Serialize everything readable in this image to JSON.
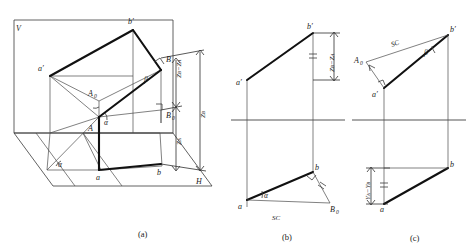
{
  "figure": {
    "captions": [
      {
        "id": "cap-a",
        "text": "(a)",
        "x": 138,
        "y": 237
      },
      {
        "id": "cap-b",
        "text": "(b)",
        "x": 285,
        "y": 240
      },
      {
        "id": "cap-c",
        "text": "(c)",
        "x": 412,
        "y": 241
      }
    ],
    "panel_a": {
      "name": "pictorial-projection-diagram",
      "plane_labels": [
        {
          "id": "v-plane",
          "text": "V",
          "x": 16,
          "y": 28
        },
        {
          "id": "h-plane",
          "text": "H",
          "x": 196,
          "y": 184
        }
      ],
      "points": [
        {
          "id": "a-prime",
          "text": "a′",
          "x": 40,
          "y": 69
        },
        {
          "id": "b-prime",
          "text": "b′",
          "x": 128,
          "y": 22
        },
        {
          "id": "point-B",
          "text": "B",
          "x": 166,
          "y": 61
        },
        {
          "id": "point-A",
          "text": "A",
          "x": 82,
          "y": 129
        },
        {
          "id": "point-a",
          "text": "a",
          "x": 97,
          "y": 176
        },
        {
          "id": "point-b",
          "text": "b",
          "x": 158,
          "y": 172
        },
        {
          "id": "point-A0",
          "text": "A",
          "sub": "0",
          "x": 91,
          "y": 94
        },
        {
          "id": "point-B0",
          "text": "B",
          "sub": "0",
          "x": 172,
          "y": 116
        }
      ],
      "angles": [
        {
          "id": "alpha-at-A",
          "text": "α",
          "x": 99,
          "y": 122
        },
        {
          "id": "alpha-at-a",
          "text": "α",
          "x": 101,
          "y": 152
        },
        {
          "id": "alpha-lower-left",
          "text": "α",
          "x": 53,
          "y": 165
        },
        {
          "id": "beta-at-B",
          "text": "β",
          "x": 145,
          "y": 80
        }
      ],
      "dimensions": [
        {
          "id": "dim-zb-minus-za",
          "text": "Zʙ−Zᴀ",
          "label": "ZB-ZA",
          "x": 181,
          "y": 75,
          "rotate": -90
        },
        {
          "id": "dim-za",
          "text": "Zᴀ",
          "label": "ZA",
          "x": 181,
          "y": 131,
          "rotate": -90
        },
        {
          "id": "dim-zb",
          "text": "Zʙ",
          "label": "ZB",
          "x": 205,
          "y": 100,
          "rotate": -90
        }
      ]
    },
    "panel_b": {
      "name": "frontal-projection-alpha-construction",
      "points": [
        {
          "id": "b-a-prime",
          "text": "a′",
          "x": 238,
          "y": 83
        },
        {
          "id": "b-b-prime",
          "text": "b′",
          "x": 305,
          "y": 28
        },
        {
          "id": "b-a",
          "text": "a",
          "x": 241,
          "y": 205
        },
        {
          "id": "b-b",
          "text": "b",
          "x": 310,
          "y": 169
        },
        {
          "id": "b-B0",
          "text": "B",
          "sub": "0",
          "x": 327,
          "y": 209
        }
      ],
      "angles": [
        {
          "id": "b-alpha",
          "text": "α",
          "x": 259,
          "y": 194
        }
      ],
      "dimensions": [
        {
          "id": "b-dim-zb-za",
          "text": "Zʙ−Zᴀ",
          "label": "ZB-ZA",
          "x": 331,
          "y": 56,
          "rotate": -90
        },
        {
          "id": "b-sc",
          "text": "SC",
          "x": 272,
          "y": 219
        }
      ]
    },
    "panel_c": {
      "name": "horizontal-projection-beta-construction",
      "points": [
        {
          "id": "c-A0",
          "text": "A",
          "sub": "0",
          "x": 356,
          "y": 60
        },
        {
          "id": "c-a-prime",
          "text": "a′",
          "x": 375,
          "y": 91
        },
        {
          "id": "c-b-prime",
          "text": "b′",
          "x": 441,
          "y": 31
        },
        {
          "id": "c-a",
          "text": "a",
          "x": 381,
          "y": 207
        },
        {
          "id": "c-b",
          "text": "b",
          "x": 443,
          "y": 168
        }
      ],
      "angles": [
        {
          "id": "c-beta",
          "text": "β",
          "x": 421,
          "y": 52
        }
      ],
      "dimensions": [
        {
          "id": "c-sc",
          "text": "SC",
          "x": 392,
          "y": 44
        },
        {
          "id": "c-dim-ya-yb",
          "text": "Yᴀ−Yʙ",
          "label": "YA-YB",
          "x": 366,
          "y": 190,
          "rotate": -90
        }
      ]
    },
    "colors": {
      "bold_line": "#111111",
      "thin_line": "#3a3a3a",
      "axis_line": "#555555",
      "text": "#1a1a1a",
      "background": "#ffffff"
    }
  }
}
